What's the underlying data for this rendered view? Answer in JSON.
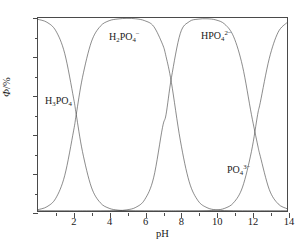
{
  "figure": {
    "caption_fragment": "",
    "background": "#ffffff",
    "line_color": "#3c3c3c",
    "axis_color": "#4a4a4a"
  },
  "axes": {
    "x": {
      "title": "pH",
      "min": 0,
      "max": 14,
      "major_ticks": [
        0,
        2,
        4,
        6,
        8,
        10,
        12,
        14
      ],
      "major_tick_labels": [
        "",
        "2",
        "4",
        "6",
        "8",
        "10",
        "12",
        "14"
      ],
      "minor_ticks": [
        1,
        3,
        5,
        7,
        9,
        11,
        13
      ]
    },
    "y": {
      "title_symbol": "Φ",
      "title_unit": "/%",
      "min": 0,
      "max": 100,
      "major_ticks": [
        0,
        20,
        40,
        60,
        80,
        100
      ],
      "major_tick_labels": [
        "0",
        "20",
        "40",
        "60",
        "80",
        "100"
      ],
      "minor_ticks": [
        10,
        30,
        50,
        70,
        90
      ]
    }
  },
  "annotations": [
    {
      "name": "h3po4",
      "formula": "H3PO4",
      "base": "H",
      "sub1": "3",
      "mid": "PO",
      "sub2": "4",
      "charge": "",
      "x_px": 44,
      "y_px": 94
    },
    {
      "name": "h2po4",
      "formula": "H2PO4-",
      "base": "H",
      "sub1": "2",
      "mid": "PO",
      "sub2": "4",
      "charge": "−",
      "x_px": 108,
      "y_px": 30
    },
    {
      "name": "hpo4",
      "formula": "HPO42-",
      "base": "H",
      "sub1": "",
      "mid": "PO",
      "sub2": "4",
      "charge": "2−",
      "x_px": 200,
      "y_px": 29
    },
    {
      "name": "po4",
      "formula": "PO43-",
      "base": "",
      "sub1": "",
      "mid": "PO",
      "sub2": "4",
      "charge": "3−",
      "x_px": 226,
      "y_px": 163
    }
  ],
  "chart_data": {
    "type": "line",
    "title": "",
    "xlabel": "pH",
    "ylabel": "Φ/%",
    "xlim": [
      0,
      14
    ],
    "ylim": [
      0,
      100
    ],
    "grid": false,
    "legend": "in-plot annotations",
    "pka": [
      2.15,
      7.2,
      12.35
    ],
    "x": [
      0,
      0.5,
      1,
      1.5,
      2,
      2.15,
      2.5,
      3,
      3.5,
      4,
      4.5,
      5,
      5.5,
      6,
      6.5,
      7,
      7.2,
      7.5,
      8,
      8.5,
      9,
      9.5,
      10,
      10.5,
      11,
      11.5,
      12,
      12.35,
      12.5,
      13,
      13.5,
      14
    ],
    "series": [
      {
        "name": "H3PO4",
        "label": "H₃PO₄",
        "values": [
          99.3,
          97.8,
          93.4,
          81.7,
          58.5,
          50.0,
          30.8,
          12.4,
          4.3,
          1.4,
          0.44,
          0.14,
          0.04,
          0.01,
          0.0,
          0.0,
          0.0,
          0.0,
          0.0,
          0.0,
          0.0,
          0.0,
          0.0,
          0.0,
          0.0,
          0.0,
          0.0,
          0.0,
          0.0,
          0.0,
          0.0,
          0.0
        ]
      },
      {
        "name": "H2PO4-",
        "label": "H₂PO₄⁻",
        "values": [
          0.7,
          2.2,
          6.6,
          18.3,
          41.5,
          50.0,
          69.2,
          87.6,
          95.7,
          98.6,
          99.5,
          99.8,
          99.6,
          98.6,
          95.7,
          86.4,
          80.0,
          66.6,
          36.7,
          15.2,
          5.3,
          1.74,
          0.56,
          0.18,
          0.06,
          0.02,
          0.005,
          0.002,
          0.001,
          0.0,
          0.0,
          0.0
        ]
      },
      {
        "name": "HPO42-",
        "label": "HPO₄²⁻",
        "values": [
          0.0,
          0.0,
          0.0,
          0.0,
          0.0,
          0.0,
          0.0,
          0.0,
          0.02,
          0.06,
          0.2,
          0.6,
          1.9,
          5.9,
          17.2,
          43.3,
          50.0,
          69.0,
          92.0,
          98.1,
          99.4,
          99.6,
          99.0,
          96.8,
          90.3,
          75.0,
          50.0,
          34.2,
          28.3,
          11.2,
          3.7,
          1.2
        ]
      },
      {
        "name": "PO43-",
        "label": "PO₄³⁻",
        "values": [
          0.0,
          0.0,
          0.0,
          0.0,
          0.0,
          0.0,
          0.0,
          0.0,
          0.0,
          0.0,
          0.0,
          0.0,
          0.0,
          0.0,
          0.0,
          0.0,
          0.0,
          0.0,
          0.0,
          0.01,
          0.04,
          0.14,
          0.45,
          1.4,
          4.3,
          12.4,
          30.8,
          50.0,
          56.3,
          78.9,
          92.6,
          97.6
        ]
      }
    ]
  }
}
